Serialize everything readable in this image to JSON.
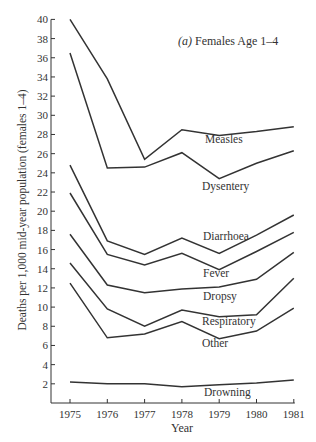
{
  "chart_data": {
    "type": "line",
    "title": "(a) Females Age 1–4",
    "title_prefix": "(a)",
    "title_text": "Females Age 1–4",
    "xlabel": "Year",
    "ylabel": "Deaths per 1,000 mid-year population (females 1–4)",
    "x": [
      1975,
      1976,
      1977,
      1978,
      1979,
      1980,
      1981
    ],
    "xticks": [
      "1975",
      "1976",
      "1977",
      "1978",
      "1979",
      "1980",
      "1981"
    ],
    "yticks": [
      2,
      4,
      6,
      8,
      10,
      12,
      14,
      16,
      18,
      20,
      22,
      24,
      26,
      28,
      30,
      32,
      34,
      36,
      38,
      40
    ],
    "ylim": [
      0,
      40
    ],
    "grid": false,
    "legend": "inline labels",
    "series": [
      {
        "name": "Measles",
        "values": [
          40.0,
          33.8,
          25.4,
          28.5,
          27.9,
          28.3,
          28.8
        ],
        "label_pos": [
          205,
          143
        ]
      },
      {
        "name": "Dysentery",
        "values": [
          36.5,
          24.5,
          24.6,
          26.1,
          23.4,
          25.0,
          26.3
        ],
        "label_pos": [
          202,
          190
        ]
      },
      {
        "name": "Diarrhoea",
        "values": [
          24.8,
          16.9,
          15.5,
          17.2,
          15.6,
          17.5,
          19.6
        ],
        "label_pos": [
          203,
          240
        ]
      },
      {
        "name": "Fever",
        "values": [
          21.9,
          15.5,
          14.4,
          15.6,
          13.9,
          15.8,
          17.8
        ],
        "label_pos": [
          203,
          277
        ]
      },
      {
        "name": "Dropsy",
        "values": [
          17.6,
          12.3,
          11.5,
          11.9,
          12.1,
          12.9,
          15.7
        ],
        "label_pos": [
          203,
          300
        ]
      },
      {
        "name": "Respiratory",
        "values": [
          14.6,
          9.8,
          8.0,
          9.7,
          9.0,
          9.2,
          13.0
        ],
        "label_pos": [
          202,
          325
        ]
      },
      {
        "name": "Other",
        "values": [
          12.5,
          6.8,
          7.2,
          8.5,
          6.7,
          7.5,
          9.9
        ],
        "label_pos": [
          202,
          347
        ]
      },
      {
        "name": "Drowning",
        "values": [
          2.2,
          2.0,
          2.0,
          1.7,
          1.9,
          2.1,
          2.4
        ],
        "label_pos": [
          204,
          396
        ]
      }
    ]
  }
}
